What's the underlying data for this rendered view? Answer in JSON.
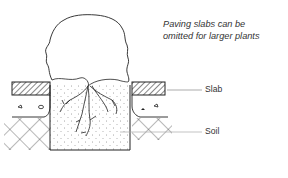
{
  "diagram": {
    "caption": {
      "line1": "Paving slabs can be",
      "line2": "omitted for larger plants"
    },
    "labels": {
      "slab": "Slab",
      "soil": "Soil"
    },
    "colors": {
      "ink": "#222222",
      "leader": "#888888",
      "background": "#ffffff"
    }
  }
}
